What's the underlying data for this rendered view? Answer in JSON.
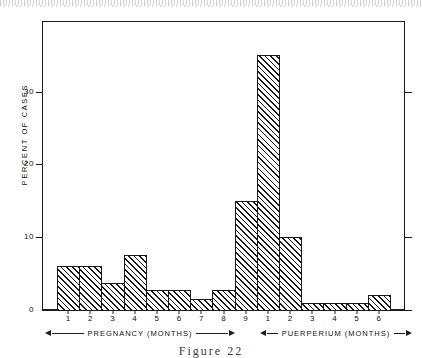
{
  "figure": {
    "caption": "Figure  22"
  },
  "chart_data": {
    "type": "bar",
    "title": "",
    "xlabel": "",
    "ylabel": "PERCENT  OF  CASES",
    "ylim": [
      0,
      38
    ],
    "yticks": [
      0,
      10,
      20,
      30
    ],
    "ytick_labels": [
      "0",
      "10",
      "20",
      "30"
    ],
    "grid": false,
    "legend": false,
    "categories": [
      "1",
      "2",
      "3",
      "4",
      "5",
      "6",
      "7",
      "8",
      "9",
      "1",
      "2",
      "3",
      "4",
      "5",
      "6"
    ],
    "values": [
      6,
      6,
      3.7,
      7.5,
      2.7,
      2.7,
      1.5,
      2.7,
      15,
      35,
      10,
      1,
      1,
      1,
      2
    ],
    "groups": [
      {
        "label": "PREGNANCY   (MONTHS)",
        "categories": [
          "1",
          "2",
          "3",
          "4",
          "5",
          "6",
          "7",
          "8",
          "9"
        ]
      },
      {
        "label": "PUERPERIUM   (MONTHS)",
        "categories": [
          "1",
          "2",
          "3",
          "4",
          "5",
          "6"
        ]
      }
    ],
    "bar_fill": "diagonal-hatch",
    "bar_edge_color": "#1a1a1a",
    "axis_color": "#1c1c1c"
  }
}
